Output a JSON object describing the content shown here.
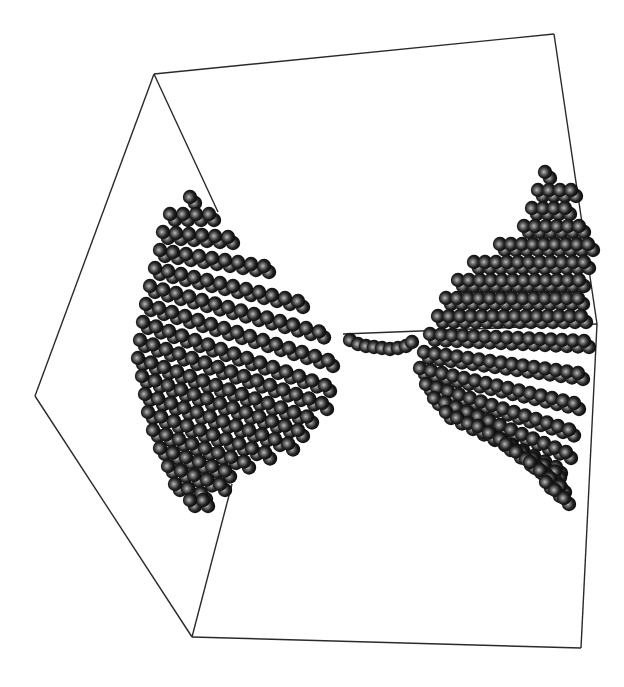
{
  "figure": {
    "background": "#ffffff",
    "edge_color": "#2a2a2a",
    "sphere": {
      "radius": 7.2,
      "highlight": "#b8b8b8",
      "mid": "#3a3a3a",
      "dark": "#050505"
    }
  },
  "box_edges": [
    [
      [
        154,
        74
      ],
      [
        554,
        34
      ]
    ],
    [
      [
        554,
        34
      ],
      [
        597,
        324
      ]
    ],
    [
      [
        597,
        324
      ],
      [
        581,
        648
      ]
    ],
    [
      [
        581,
        648
      ],
      [
        192,
        637
      ]
    ],
    [
      [
        192,
        637
      ],
      [
        35,
        396
      ]
    ],
    [
      [
        35,
        396
      ],
      [
        154,
        74
      ]
    ],
    [
      [
        154,
        74
      ],
      [
        218,
        212
      ]
    ],
    [
      [
        343,
        334
      ],
      [
        597,
        324
      ]
    ],
    [
      [
        192,
        637
      ],
      [
        232,
        484
      ]
    ]
  ],
  "clusters": {
    "left": {
      "rows": [
        {
          "x": 190,
          "y": 197,
          "dx": 13,
          "dy": 0,
          "n": 1
        },
        {
          "x": 170,
          "y": 214,
          "dx": 13,
          "dy": 0,
          "n": 4
        },
        {
          "x": 163,
          "y": 232,
          "dx": 13,
          "dy": 1,
          "n": 6
        },
        {
          "x": 160,
          "y": 250,
          "dx": 13,
          "dy": 2,
          "n": 9
        },
        {
          "x": 155,
          "y": 268,
          "dx": 13,
          "dy": 3,
          "n": 12
        },
        {
          "x": 150,
          "y": 286,
          "dx": 13,
          "dy": 3.5,
          "n": 14
        },
        {
          "x": 146,
          "y": 304,
          "dx": 13,
          "dy": 4,
          "n": 15
        },
        {
          "x": 143,
          "y": 322,
          "dx": 13,
          "dy": 4.5,
          "n": 15
        },
        {
          "x": 140,
          "y": 340,
          "dx": 13,
          "dy": 4.5,
          "n": 15
        },
        {
          "x": 138,
          "y": 358,
          "dx": 13,
          "dy": 4.5,
          "n": 14
        },
        {
          "x": 142,
          "y": 376,
          "dx": 13,
          "dy": 4.5,
          "n": 13
        },
        {
          "x": 145,
          "y": 394,
          "dx": 13,
          "dy": 4.5,
          "n": 12
        },
        {
          "x": 148,
          "y": 412,
          "dx": 13,
          "dy": 4.5,
          "n": 10
        },
        {
          "x": 153,
          "y": 430,
          "dx": 13,
          "dy": 4.5,
          "n": 8
        },
        {
          "x": 160,
          "y": 448,
          "dx": 13,
          "dy": 4.5,
          "n": 6
        },
        {
          "x": 168,
          "y": 466,
          "dx": 13,
          "dy": 4.5,
          "n": 5
        },
        {
          "x": 175,
          "y": 484,
          "dx": 13,
          "dy": 4.5,
          "n": 3
        },
        {
          "x": 190,
          "y": 500,
          "dx": 13,
          "dy": 0,
          "n": 2
        }
      ]
    },
    "bridge": [
      [
        350,
        340
      ],
      [
        358,
        344
      ],
      [
        366,
        346
      ],
      [
        374,
        347
      ],
      [
        382,
        348
      ],
      [
        390,
        349
      ],
      [
        398,
        348
      ],
      [
        406,
        346
      ],
      [
        412,
        342
      ]
    ],
    "right": {
      "rows": [
        {
          "x": 545,
          "y": 172,
          "dx": 12,
          "dy": 0,
          "n": 1
        },
        {
          "x": 538,
          "y": 190,
          "dx": 11,
          "dy": 0,
          "n": 4
        },
        {
          "x": 532,
          "y": 208,
          "dx": 11,
          "dy": 0,
          "n": 4
        },
        {
          "x": 524,
          "y": 226,
          "dx": 11,
          "dy": 0,
          "n": 6
        },
        {
          "x": 500,
          "y": 244,
          "dx": 11,
          "dy": 0,
          "n": 9
        },
        {
          "x": 474,
          "y": 262,
          "dx": 11,
          "dy": 0,
          "n": 11
        },
        {
          "x": 458,
          "y": 280,
          "dx": 11,
          "dy": 0,
          "n": 12
        },
        {
          "x": 446,
          "y": 298,
          "dx": 11,
          "dy": 0,
          "n": 13
        },
        {
          "x": 438,
          "y": 316,
          "dx": 11,
          "dy": 0,
          "n": 14
        },
        {
          "x": 430,
          "y": 334,
          "dx": 11,
          "dy": 0.5,
          "n": 15
        },
        {
          "x": 424,
          "y": 352,
          "dx": 11,
          "dy": 1.5,
          "n": 15
        },
        {
          "x": 420,
          "y": 368,
          "dx": 11,
          "dy": 2.5,
          "n": 15
        },
        {
          "x": 426,
          "y": 384,
          "dx": 11,
          "dy": 3.5,
          "n": 14
        },
        {
          "x": 434,
          "y": 398,
          "dx": 11,
          "dy": 4.5,
          "n": 13
        },
        {
          "x": 446,
          "y": 412,
          "dx": 11,
          "dy": 5.5,
          "n": 11
        },
        {
          "x": 478,
          "y": 426,
          "dx": 11,
          "dy": 6.5,
          "n": 8
        },
        {
          "x": 506,
          "y": 444,
          "dx": 10,
          "dy": 7.5,
          "n": 6
        },
        {
          "x": 530,
          "y": 462,
          "dx": 10,
          "dy": 8,
          "n": 4
        },
        {
          "x": 546,
          "y": 482,
          "dx": 9,
          "dy": 8,
          "n": 3
        }
      ]
    }
  }
}
